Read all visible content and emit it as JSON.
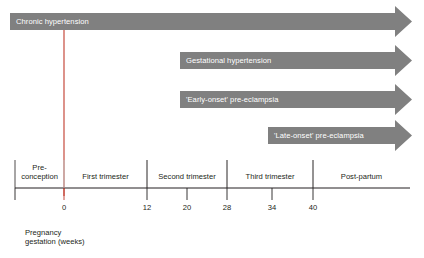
{
  "figure": {
    "type": "timeline-diagram",
    "title_visible": "",
    "colors": {
      "arrow_fill": "#808080",
      "axis_line": "#231f20",
      "grid_line": "#bfbfbf",
      "marker_line": "#c0392b",
      "text": "#231f20",
      "arrow_text": "#ffffff",
      "background": "#ffffff"
    }
  },
  "arrows": [
    {
      "label": "Chronic hypertension",
      "start_week": "pre-conception",
      "start_x": 10,
      "top": 13,
      "height": 17,
      "body_end": 395,
      "tip": 412,
      "head_top": 6,
      "head_bottom": 37
    },
    {
      "label": "Gestational hypertension",
      "start_week": "20",
      "start_x": 180,
      "top": 52,
      "height": 17,
      "body_end": 395,
      "tip": 412,
      "head_top": 45,
      "head_bottom": 76
    },
    {
      "label": "'Early-onset' pre-eclampsia",
      "start_week": "20",
      "start_x": 180,
      "top": 91,
      "height": 17,
      "body_end": 395,
      "tip": 412,
      "head_top": 84,
      "head_bottom": 115
    },
    {
      "label": "'Late-onset' pre-eclampsia",
      "start_week": "34",
      "start_x": 268,
      "top": 127,
      "height": 17,
      "body_end": 395,
      "tip": 412,
      "head_top": 120,
      "head_bottom": 151
    }
  ],
  "axis": {
    "line_y": 188,
    "line_start_x": 15,
    "line_end_x": 410,
    "caption_line1": "Pregnancy",
    "caption_line2": "gestation (weeks)",
    "periods": [
      {
        "label_line1": "Pre-",
        "label_line2": "conception",
        "start_x": 15,
        "end_x": 64,
        "center_x": 39
      },
      {
        "label_line1": "First trimester",
        "label_line2": "",
        "start_x": 64,
        "end_x": 147,
        "center_x": 105
      },
      {
        "label_line1": "Second trimester",
        "label_line2": "",
        "start_x": 147,
        "end_x": 227,
        "center_x": 187
      },
      {
        "label_line1": "Third trimester",
        "label_line2": "",
        "start_x": 227,
        "end_x": 313,
        "center_x": 270
      },
      {
        "label_line1": "Post-partum",
        "label_line2": "",
        "start_x": 313,
        "end_x": 410,
        "center_x": 361
      }
    ],
    "ticks": [
      {
        "label": "",
        "x": 15
      },
      {
        "label": "0",
        "x": 64
      },
      {
        "label": "12",
        "x": 147
      },
      {
        "label": "20",
        "x": 187
      },
      {
        "label": "28",
        "x": 227
      },
      {
        "label": "34",
        "x": 272
      },
      {
        "label": "40",
        "x": 313
      }
    ]
  },
  "chart_data": {
    "type": "bar",
    "xlabel": "Pregnancy gestation (weeks)",
    "ylabel": "",
    "xlim": [
      -10,
      48
    ],
    "categories": [
      "Chronic hypertension",
      "Gestational hypertension",
      "'Early-onset' pre-eclampsia",
      "'Late-onset' pre-eclampsia"
    ],
    "series": [
      {
        "name": "onset_week",
        "values": [
          "pre-conception",
          20,
          20,
          34
        ]
      },
      {
        "name": "end_week",
        "values": [
          "post-partum",
          "post-partum",
          "post-partum",
          "post-partum"
        ]
      }
    ],
    "tick_labels": [
      "0",
      "12",
      "20",
      "28",
      "34",
      "40"
    ],
    "tick_values": [
      0,
      12,
      20,
      28,
      34,
      40
    ],
    "period_bands": [
      "Pre-conception",
      "First trimester",
      "Second trimester",
      "Third trimester",
      "Post-partum"
    ],
    "grid": false,
    "legend": "none"
  }
}
